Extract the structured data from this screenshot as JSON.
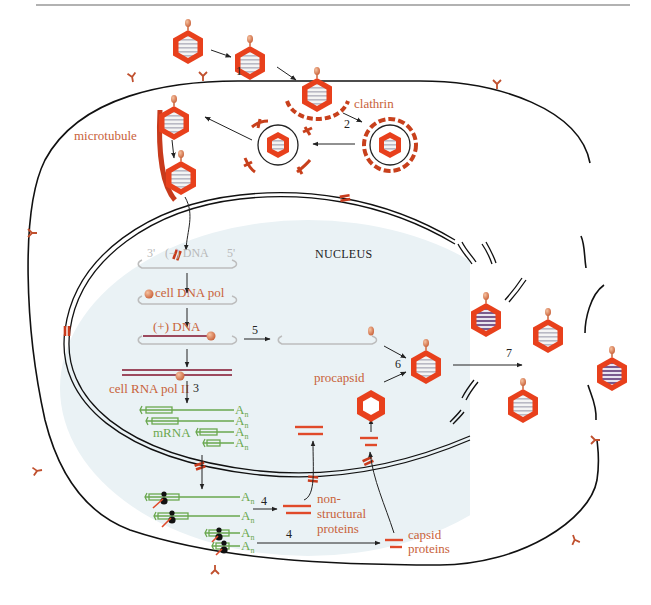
{
  "figure": {
    "header_rule": true
  },
  "labels": {
    "clathrin": "clathrin",
    "microtubule": "microtubule",
    "nucleus": "NUCLEUS",
    "minus_dna": "(−) DNA",
    "three_prime": "3'",
    "five_prime": "5'",
    "cell_dna_pol": "cell DNA pol",
    "plus_dna": "(+) DNA",
    "cell_rna_pol": "cell RNA pol II",
    "mrna": "mRNA",
    "poly_a": "A",
    "poly_a_sub": "n",
    "procapsid": "procapsid",
    "nonstructural_1": "non-",
    "nonstructural_2": "structural",
    "nonstructural_3": "proteins",
    "capsid_1": "capsid",
    "capsid_2": "proteins"
  },
  "steps": {
    "s1": "1",
    "s2": "2",
    "s3": "3",
    "s4a": "4",
    "s4b": "4",
    "s5": "5",
    "s6": "6",
    "s7": "7"
  },
  "colors": {
    "capsid": "#e8401c",
    "receptor": "#c0502e",
    "membrane": "#111111",
    "nucleus_fill": "#eaf2f5",
    "mrna": "#6aa84f",
    "dna_plus": "#9c4a5e",
    "dna_minus": "#bdbdbd",
    "label_red": "#c8623a"
  }
}
